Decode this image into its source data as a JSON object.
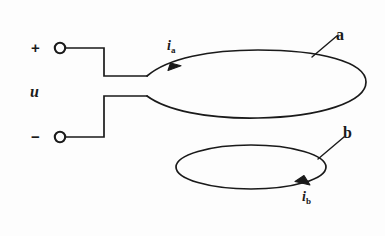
{
  "figure": {
    "background_color": "#fdfdfd",
    "ink_color": "#1a1a1a",
    "stroke_width": 1.6
  },
  "source": {
    "positive_sign": "+",
    "negative_sign": "−",
    "voltage_label": "u",
    "positive_terminal_name": "positive-terminal",
    "negative_terminal_name": "negative-terminal"
  },
  "loops": [
    {
      "id": "a",
      "label": "a",
      "current_symbol": "i",
      "current_subscript": "a",
      "arrow_direction": "right"
    },
    {
      "id": "b",
      "label": "b",
      "current_symbol": "i",
      "current_subscript": "b",
      "arrow_direction": "left"
    }
  ],
  "icons": {
    "terminal": "open-circle-terminal",
    "arrowhead": "solid-triangle-arrowhead",
    "leader": "leader-line"
  }
}
